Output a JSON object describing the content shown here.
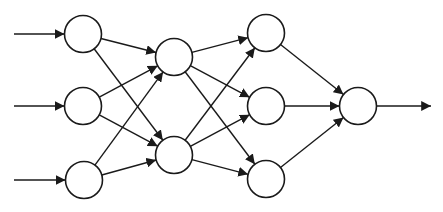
{
  "diagram": {
    "type": "neural-network",
    "width": 443,
    "height": 212,
    "colors": {
      "stroke": "#1a1a1a",
      "node_fill": "#ffffff",
      "background": "#ffffff"
    },
    "node_radius": 18.5,
    "layers": [
      {
        "name": "input-layer",
        "nodes": [
          {
            "id": "i1",
            "x": 83,
            "y": 34
          },
          {
            "id": "i2",
            "x": 83,
            "y": 106
          },
          {
            "id": "i3",
            "x": 84,
            "y": 180
          }
        ]
      },
      {
        "name": "hidden-layer-1",
        "nodes": [
          {
            "id": "h1",
            "x": 174,
            "y": 57
          },
          {
            "id": "h2",
            "x": 174,
            "y": 155
          }
        ]
      },
      {
        "name": "hidden-layer-2",
        "nodes": [
          {
            "id": "g1",
            "x": 266,
            "y": 33
          },
          {
            "id": "g2",
            "x": 266,
            "y": 106
          },
          {
            "id": "g3",
            "x": 266,
            "y": 179
          }
        ]
      },
      {
        "name": "output-layer",
        "nodes": [
          {
            "id": "o1",
            "x": 358,
            "y": 106
          }
        ]
      }
    ],
    "input_arrows": [
      {
        "to": "i1",
        "x_start": 14
      },
      {
        "to": "i2",
        "x_start": 14
      },
      {
        "to": "i3",
        "x_start": 14
      }
    ],
    "output_arrows": [
      {
        "from": "o1",
        "x_end": 431
      }
    ],
    "connectivity": "fully-connected-between-adjacent-layers"
  }
}
